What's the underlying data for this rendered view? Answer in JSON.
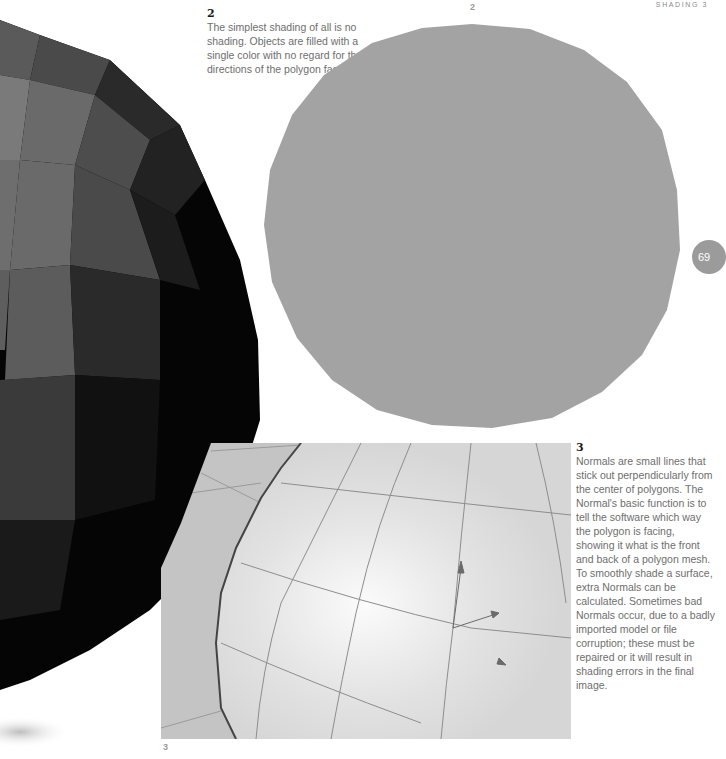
{
  "page": {
    "running_header": "SHADING 3",
    "page_number": "69"
  },
  "figures": [
    {
      "id": "1",
      "description": "faceted-sphere-render",
      "colors": {
        "dark": "#050505",
        "mid": "#3a3a3a",
        "light": "#707070"
      }
    },
    {
      "id": "2",
      "label": "2",
      "description": "flat-shaded-circle",
      "fill": "#a3a3a3"
    },
    {
      "id": "3",
      "label": "3",
      "description": "sphere-with-normals-wireframe"
    }
  ],
  "captions": {
    "fig2": {
      "number": "2",
      "text": "The simplest shading of all is no shading. Objects are filled with a single color with no regard for the directions of the polygon faces."
    },
    "fig3": {
      "number": "3",
      "text": "Normals are small lines that stick out perpendicularly from the center of polygons. The Normal's basic function is to tell the software which way the polygon is facing, showing it what is the front and back of a polygon mesh. To smoothly shade a surface, extra Normals can be calculated. Sometimes bad Normals occur, due to a badly imported model or file corruption; these must be repaired or it will result in shading errors in the final image."
    }
  }
}
